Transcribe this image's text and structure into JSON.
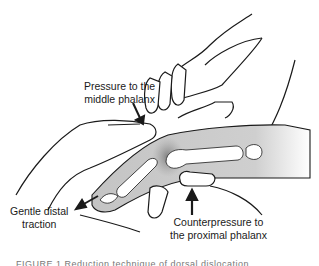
{
  "figure": {
    "labels": {
      "pressure_middle": [
        "Pressure to the",
        "middle phalanx"
      ],
      "distal_traction": [
        "Gentle distal",
        "traction"
      ],
      "counterpressure": [
        "Counterpressure to",
        "the proximal phalanx"
      ]
    },
    "caption_partial": "FIGURE 1   Reduction technique of dorsal dislocation",
    "colors": {
      "line": "#1a1a1a",
      "finger_shade": "#c8c8c8",
      "bone": "#ffffff",
      "joint_shade": "#8f8f8f"
    }
  }
}
